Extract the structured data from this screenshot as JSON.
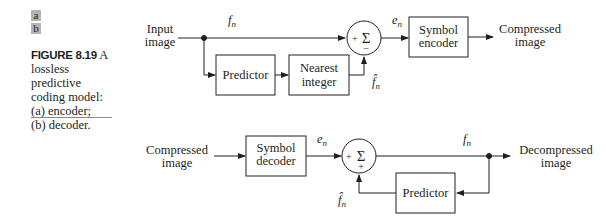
{
  "figure": {
    "tags": [
      "a",
      "b"
    ],
    "number": "FIGURE 8.19",
    "caption_lead": "A",
    "caption_lines": [
      "lossless predictive",
      "coding model:",
      "(a) encoder;",
      "(b) decoder."
    ]
  },
  "encoder": {
    "input_label": [
      "Input",
      "image"
    ],
    "signal_fn": "f",
    "signal_sub": "n",
    "predictor": "Predictor",
    "nearest_integer": [
      "Nearest",
      "integer"
    ],
    "fhat": "f̂",
    "fhat_sub": "n",
    "sum_symbol": "Σ",
    "sum_plus": "+",
    "sum_minus": "−",
    "error_e": "e",
    "error_sub": "n",
    "symbol_encoder": [
      "Symbol",
      "encoder"
    ],
    "output_label": [
      "Compressed",
      "image"
    ]
  },
  "decoder": {
    "input_label": [
      "Compressed",
      "image"
    ],
    "symbol_decoder": [
      "Symbol",
      "decoder"
    ],
    "error_e": "e",
    "error_sub": "n",
    "sum_symbol": "Σ",
    "sum_plus_left": "+",
    "sum_plus_bottom": "+",
    "signal_fn": "f",
    "signal_sub": "n",
    "predictor": "Predictor",
    "fhat": "f̂",
    "fhat_sub": "n",
    "output_label": [
      "Decompressed",
      "image"
    ]
  }
}
